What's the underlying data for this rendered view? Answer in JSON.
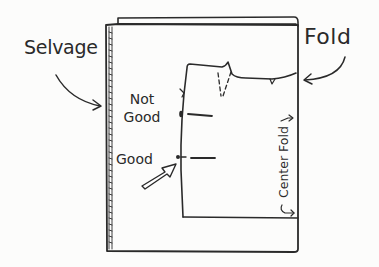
{
  "diagram": {
    "type": "sewing-pattern-layout",
    "labels": {
      "selvage": "Selvage",
      "fold": "Fold",
      "not_good_line1": "Not",
      "not_good_line2": "Good",
      "good": "Good",
      "center_fold": "Center Fold"
    },
    "elements": [
      {
        "id": "fabric",
        "kind": "rectangle",
        "note": "folded fabric with selvage edge on left and fold at top/right"
      },
      {
        "id": "pattern-piece",
        "kind": "outline",
        "note": "pattern piece with dart and notch, center fold on right edge"
      },
      {
        "id": "grainline-not-good",
        "kind": "grainline-marker",
        "status": "Not Good"
      },
      {
        "id": "grainline-good",
        "kind": "grainline-marker",
        "status": "Good"
      },
      {
        "id": "pointer-arrow",
        "kind": "outlined-arrow",
        "points_to": "grainline-good"
      },
      {
        "id": "selvage-arrow",
        "kind": "curved-arrow",
        "points_to": "selvage-edge"
      },
      {
        "id": "fold-arrow",
        "kind": "curved-arrow",
        "points_to": "fold-edge"
      }
    ],
    "colors": {
      "ink": "#2a2a2a",
      "paper": "#fcfcfb"
    }
  }
}
